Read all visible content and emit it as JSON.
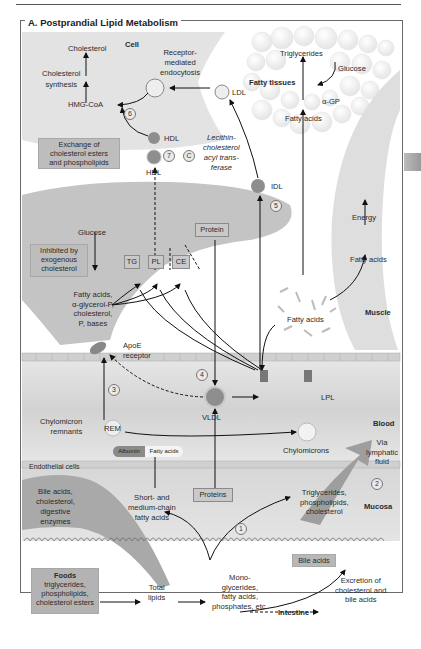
{
  "figure": {
    "title": "A. Postprandial Lipid Metabolism",
    "side_tab_color": "#a8a8a8"
  },
  "regions": {
    "cell": "Cell",
    "fatty_tissues": "Fatty tissues",
    "muscle": "Muscle",
    "blood": "Blood",
    "mucosa": "Mucosa",
    "intestine": "Intestine",
    "endothelial_cells": "Endothelial cells"
  },
  "cell": {
    "cholesterol": "Cholesterol",
    "cholesterol_synthesis": [
      "Cholesterol",
      "synthesis"
    ],
    "hmg_coa": "HMG-CoA",
    "receptor_endocytosis": [
      "Receptor-",
      "mediated",
      "endocytosis"
    ],
    "ldl": "LDL"
  },
  "fatty_tissue": {
    "triglycerides": "Triglycerides",
    "glucose": "Glucose",
    "alpha_gp": "α-GP",
    "fatty_acids": "Fatty acids"
  },
  "hdl": {
    "exchange_box": [
      "Exchange of",
      "cholesterol esters",
      "and phospholipids"
    ],
    "hdl_top": "HDL",
    "hdl_bottom": "HDL",
    "lcat": [
      "Lecithin-",
      "cholesterol",
      "acyl trans-",
      "ferase"
    ],
    "idl": "IDL"
  },
  "liver": {
    "glucose": "Glucose",
    "inhibited_box": [
      "Inhibited by",
      "exogenous",
      "cholesterol"
    ],
    "products": [
      "Fatty acids,",
      "α-glycerol-P,",
      "cholesterol,",
      "P, bases"
    ],
    "tg": "TG",
    "pl": "PL",
    "ce": "CE",
    "protein": "Protein",
    "apoe": [
      "ApoE",
      "receptor"
    ]
  },
  "muscle": {
    "energy": "Energy",
    "fatty_acids": "Fatty acids"
  },
  "blood": {
    "fatty_acids_center": "Fatty acids",
    "vldl": "VLDL",
    "lpl": "LPL",
    "rem": "REM",
    "chylomicron_remnants": [
      "Chylomicron",
      "remnants"
    ],
    "chylomicrons": "Chylomicrons",
    "albumin": "Albumin",
    "albumin_fatty_acids": "Fatty acids",
    "via_lymphatic": [
      "Via",
      "lymphatic",
      "fluid"
    ]
  },
  "mucosa": {
    "bile_digestive": [
      "Bile acids,",
      "cholesterol,",
      "digestive",
      "enzymes"
    ],
    "short_medium": [
      "Short- and",
      "medium-chain",
      "fatty acids"
    ],
    "proteins": "Proteins",
    "tg_pl_chol": [
      "Triglycerides,",
      "phospholipids,",
      "cholesterol"
    ]
  },
  "intestine": {
    "foods_title": "Foods",
    "foods_items": [
      "triglycerides,",
      "phospholipids,",
      "cholesterol esters"
    ],
    "total_lipids": [
      "Total",
      "lipids"
    ],
    "mono": [
      "Mono-",
      "glycerides,",
      "fatty acids,",
      "phosphates, etc."
    ],
    "bile_acids": "Bile acids",
    "excretion": [
      "Excretion of",
      "cholesterol and",
      "bile acids"
    ]
  },
  "step_numbers": [
    "1",
    "2",
    "3",
    "4",
    "5",
    "6",
    "7"
  ],
  "colors": {
    "organ_gray": "#c4c4c4",
    "cell_gray": "#e2e2e2",
    "blood_band": "#dcdcdc",
    "lipoprotein": "#8e8e8e",
    "box_gray": "#bdbdbd"
  }
}
